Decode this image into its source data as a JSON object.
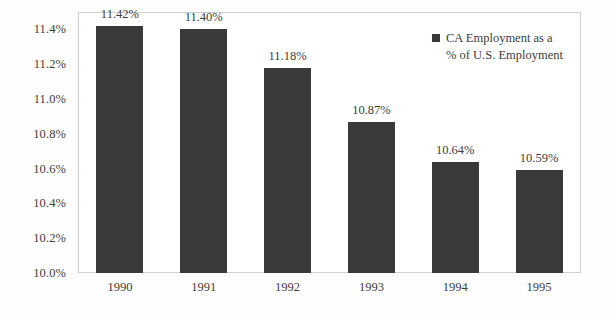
{
  "chart_data": {
    "type": "bar",
    "title": "",
    "subtitle": "",
    "xlabel": "",
    "ylabel": "",
    "categories": [
      "1990",
      "1991",
      "1992",
      "1993",
      "1994",
      "1995"
    ],
    "values": [
      11.42,
      11.4,
      11.18,
      10.87,
      10.64,
      10.59
    ],
    "value_labels": [
      "11.42%",
      "11.40%",
      "11.18%",
      "10.87%",
      "10.64%",
      "10.59%"
    ],
    "series": [
      {
        "name": "CA Employment as a % of U.S. Employment",
        "values": [
          11.42,
          11.4,
          11.18,
          10.87,
          10.64,
          10.59
        ],
        "color": "#3a3a3a"
      }
    ],
    "ylim": [
      10.0,
      11.5
    ],
    "y_axis_min_shown": 10.0,
    "y_axis_max_shown": 11.4,
    "y_tick_values": [
      10.0,
      10.2,
      10.4,
      10.6,
      10.8,
      11.0,
      11.2,
      11.4
    ],
    "y_tick_labels": [
      "10.0%",
      "10.2%",
      "10.4%",
      "10.6%",
      "10.8%",
      "11.0%",
      "11.2%",
      "11.4%"
    ],
    "grid": false,
    "legend_position": "top-right",
    "legend": {
      "marker": "filled-square",
      "marker_color": "#3a3a3a",
      "line1": "CA Employment as a",
      "line2": "% of U.S. Employment",
      "text": "CA Employment as a\n% of U.S. Employment"
    },
    "colors": {
      "bar": "#3a3a3a",
      "frame_border": "#cfcfcf",
      "plot_background": "#ffffff",
      "text": "#3d3d3d"
    }
  }
}
